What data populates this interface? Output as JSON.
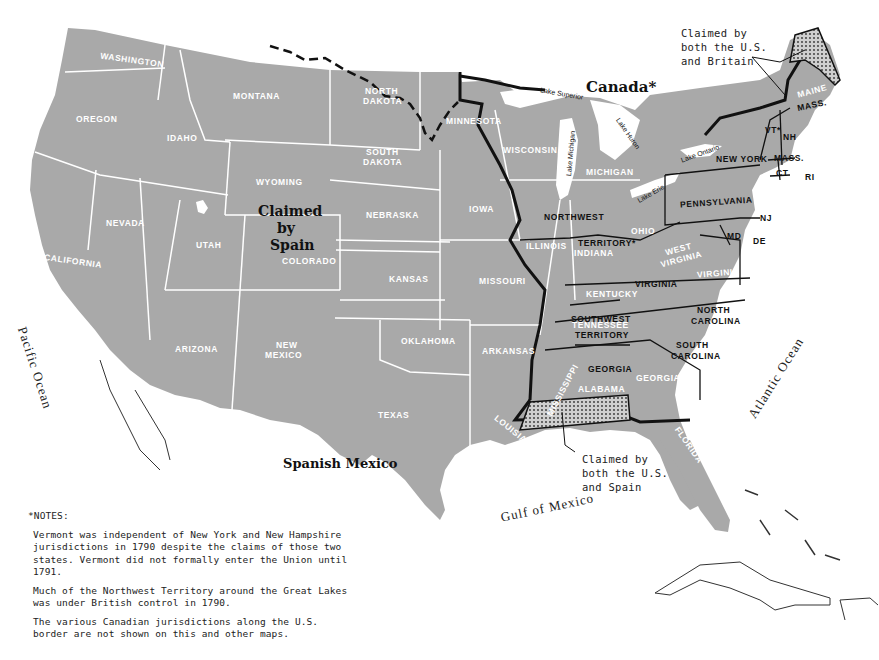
{
  "map": {
    "title_region": "United States 1790",
    "colors": {
      "land": "#a9a9a9",
      "state_border": "#ffffff",
      "us_border": "#111111",
      "water": "#ffffff"
    },
    "regions": {
      "canada": "Canada*",
      "claimed_by_spain": [
        "Claimed",
        "by",
        "Spain"
      ],
      "spanish_mexico": "Spanish Mexico"
    },
    "oceans": {
      "pacific": "Pacific Ocean",
      "atlantic": "Atlantic Ocean",
      "gulf": "Gulf of Mexico"
    },
    "lakes": {
      "superior": "Lake Superior",
      "michigan": "Lake Michigan",
      "huron": "Lake Huron",
      "ontario": "Lake Ontario",
      "erie": "Lake Erie"
    },
    "modern_states": {
      "washington": "WASHINGTON",
      "oregon": "OREGON",
      "idaho": "IDAHO",
      "montana": "MONTANA",
      "wyoming": "WYOMING",
      "california": "CALIFORNIA",
      "nevada": "NEVADA",
      "utah": "UTAH",
      "colorado": "COLORADO",
      "arizona": "ARIZONA",
      "new_mexico_1": "NEW",
      "new_mexico_2": "MEXICO",
      "north_dakota_1": "NORTH",
      "north_dakota_2": "DAKOTA",
      "south_dakota_1": "SOUTH",
      "south_dakota_2": "DAKOTA",
      "nebraska": "NEBRASKA",
      "kansas": "KANSAS",
      "oklahoma": "OKLAHOMA",
      "texas": "TEXAS",
      "minnesota": "MINNESOTA",
      "iowa": "IOWA",
      "missouri": "MISSOURI",
      "arkansas": "ARKANSAS",
      "louisiana": "LOUISIANA",
      "wisconsin": "WISCONSIN",
      "michigan": "MICHIGAN",
      "illinois": "ILLINOIS",
      "indiana": "INDIANA",
      "ohio": "OHIO",
      "kentucky": "KENTUCKY",
      "west_virginia_1": "WEST",
      "west_virginia_2": "VIRGINIA",
      "virginia_modern": "VIRGINIA",
      "tennessee": "TENNESSEE",
      "mississippi": "MISSISSIPPI",
      "alabama": "ALABAMA",
      "georgia_modern": "GEORGIA",
      "florida": "FLORIDA",
      "maine": "MAINE"
    },
    "us_1790": {
      "northwest_1": "NORTHWEST",
      "northwest_2": "TERRITORY*",
      "virginia": "VIRGINIA",
      "southwest_1": "SOUTHWEST",
      "southwest_2": "TERRITORY",
      "north_carolina_1": "NORTH",
      "north_carolina_2": "CAROLINA",
      "south_carolina_1": "SOUTH",
      "south_carolina_2": "CAROLINA",
      "georgia": "GEORGIA",
      "pennsylvania": "PENNSYLVANIA",
      "new_york": "NEW YORK",
      "vermont": "VT*",
      "new_hampshire": "NH",
      "massachusetts": "MASS.",
      "massachusetts_maine": "MASS.",
      "connecticut": "CT",
      "rhode_island": "RI",
      "new_jersey": "NJ",
      "delaware": "DE",
      "maryland": "MD"
    },
    "callouts": {
      "britain": "Claimed by\nboth the U.S.\nand Britain",
      "spain": "Claimed by\nboth the U.S.\nand Spain"
    }
  },
  "notes": {
    "title": "*NOTES:",
    "paragraphs": [
      "Vermont was independent of New York and New Hampshire jurisdictions in 1790 despite the claims of those two states.  Vermont did not formally enter the Union until 1791.",
      "Much of the Northwest Territory around the Great Lakes was under British control in 1790.",
      "The various Canadian jurisdictions along the U.S. border are not shown on this and other maps."
    ]
  }
}
